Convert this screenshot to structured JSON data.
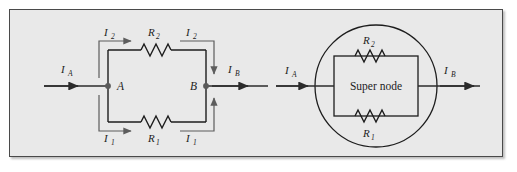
{
  "figure": {
    "panel_bg": "#e9e9e9",
    "page_bg": "#ffffff",
    "ink": "#1d1d1d",
    "arrow_gray": "#5d5d5d",
    "node_dot": "#5a5a5a"
  },
  "left_circuit": {
    "name": "two-resistor-parallel-branch",
    "node_a_label": "A",
    "node_b_label": "B",
    "current_in_label": "I",
    "current_in_sub": "A",
    "current_out_label": "I",
    "current_out_sub": "B",
    "top_branch": {
      "resistor_label": "R",
      "resistor_sub": "2",
      "current_left_label": "I",
      "current_left_sub": "2",
      "current_right_label": "I",
      "current_right_sub": "2"
    },
    "bottom_branch": {
      "resistor_label": "R",
      "resistor_sub": "1",
      "current_left_label": "I",
      "current_left_sub": "1",
      "current_right_label": "I",
      "current_right_sub": "1"
    }
  },
  "right_circuit": {
    "name": "super-node-equivalent",
    "super_node_label": "Super node",
    "current_in_label": "I",
    "current_in_sub": "A",
    "current_out_label": "I",
    "current_out_sub": "B",
    "top_resistor_label": "R",
    "top_resistor_sub": "2",
    "bottom_resistor_label": "R",
    "bottom_resistor_sub": "1"
  }
}
